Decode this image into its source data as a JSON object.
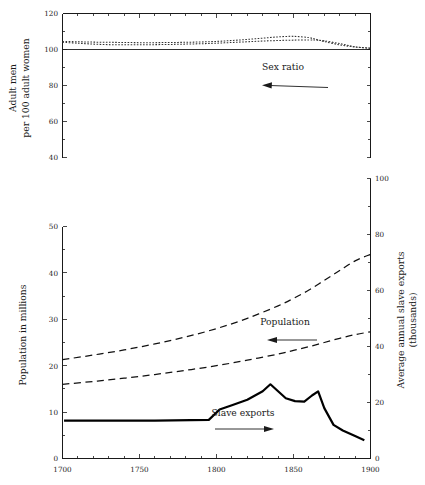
{
  "chart_data": [
    {
      "type": "line",
      "title": "Sex ratio",
      "panel": "top",
      "xlabel": "",
      "ylabel": "Adult men per 100 adult women",
      "ylabel_lines": [
        "Adult men",
        "per 100 adult women"
      ],
      "xlim": [
        1700,
        1900
      ],
      "ylim": [
        40,
        120
      ],
      "xticks": [
        1700,
        1750,
        1800,
        1850,
        1900
      ],
      "xtick_labels": [
        "",
        "",
        "",
        "",
        ""
      ],
      "yticks": [
        40,
        60,
        80,
        100,
        120
      ],
      "ytick_labels": [
        "40",
        "60",
        "80",
        "100",
        "120"
      ],
      "y_minor_step": 10,
      "x_minor_step": 10,
      "grid": false,
      "reference_line_y": 100,
      "annotations": [
        {
          "text": "Sex ratio",
          "x": 1840,
          "y": 82,
          "arrow": "left"
        }
      ],
      "series": [
        {
          "name": "Sex ratio (upper)",
          "style": "dotted",
          "x": [
            1700,
            1710,
            1720,
            1730,
            1740,
            1750,
            1760,
            1770,
            1780,
            1790,
            1800,
            1810,
            1820,
            1830,
            1840,
            1850,
            1860,
            1865,
            1870,
            1880,
            1890,
            1900
          ],
          "values": [
            104.5,
            104.3,
            104.1,
            104.0,
            103.9,
            103.8,
            103.8,
            103.9,
            104.0,
            104.2,
            104.5,
            105.0,
            105.6,
            106.3,
            107.0,
            107.3,
            106.6,
            105.6,
            104.4,
            102.6,
            101.4,
            100.8
          ]
        },
        {
          "name": "Sex ratio (lower)",
          "style": "dotted",
          "x": [
            1700,
            1710,
            1720,
            1730,
            1740,
            1750,
            1760,
            1770,
            1780,
            1790,
            1800,
            1810,
            1820,
            1830,
            1840,
            1850,
            1860,
            1865,
            1870,
            1880,
            1890,
            1900
          ],
          "values": [
            104.0,
            103.5,
            103.0,
            102.7,
            102.6,
            102.6,
            102.7,
            102.8,
            103.0,
            103.2,
            103.5,
            103.9,
            104.3,
            104.7,
            105.0,
            105.2,
            105.3,
            105.2,
            104.8,
            103.3,
            101.5,
            100.6
          ]
        }
      ]
    },
    {
      "type": "line",
      "title": "Population and slave exports",
      "panel": "bottom",
      "xlabel": "",
      "ylabel": "Population in millions",
      "ylabel_right": "Average annual slave exports (thousands)",
      "ylabel_right_lines": [
        "Average annual slave exports",
        "(thousands)"
      ],
      "xlim": [
        1700,
        1900
      ],
      "ylim": [
        0,
        50
      ],
      "ylim_right": [
        0,
        100
      ],
      "xticks": [
        1700,
        1750,
        1800,
        1850,
        1900
      ],
      "xtick_labels": [
        "1700",
        "1750",
        "1800",
        "1850",
        "1900"
      ],
      "yticks": [
        0,
        10,
        20,
        30,
        40,
        50
      ],
      "ytick_labels": [
        "0",
        "10",
        "20",
        "30",
        "40",
        "50"
      ],
      "y_minor_step": 5,
      "x_minor_step": 10,
      "yticks_right": [
        0,
        20,
        40,
        60,
        80,
        100
      ],
      "ytick_labels_right": [
        "0",
        "20",
        "40",
        "60",
        "80",
        "100"
      ],
      "y_minor_step_right": 10,
      "grid": false,
      "annotations": [
        {
          "text": "Population",
          "x": 1805,
          "y": 27.5,
          "arrow": "left"
        },
        {
          "text": "Slave exports",
          "x": 1790,
          "y": 10.5,
          "arrow": "right"
        }
      ],
      "series": [
        {
          "name": "Population (upper estimate)",
          "style": "dashed",
          "axis": "left",
          "x": [
            1700,
            1720,
            1740,
            1760,
            1780,
            1800,
            1820,
            1840,
            1850,
            1860,
            1870,
            1880,
            1890,
            1900
          ],
          "values": [
            21.3,
            22.3,
            23.4,
            24.7,
            26.2,
            28.0,
            30.2,
            32.9,
            34.5,
            36.3,
            38.4,
            40.5,
            42.6,
            44.0
          ]
        },
        {
          "name": "Population (lower estimate)",
          "style": "dashed",
          "axis": "left",
          "x": [
            1700,
            1720,
            1740,
            1760,
            1780,
            1800,
            1820,
            1840,
            1850,
            1860,
            1870,
            1880,
            1890,
            1900
          ],
          "values": [
            16.0,
            16.6,
            17.3,
            18.1,
            19.0,
            20.0,
            21.2,
            22.5,
            23.3,
            24.1,
            25.0,
            25.9,
            26.7,
            27.3
          ]
        },
        {
          "name": "Slave exports",
          "style": "solid",
          "axis": "right",
          "x": [
            1701,
            1760,
            1795,
            1802,
            1810,
            1820,
            1830,
            1835,
            1845,
            1851,
            1857,
            1862,
            1866,
            1870,
            1876,
            1882,
            1890,
            1896
          ],
          "values": [
            13.5,
            13.5,
            13.8,
            17.5,
            19.0,
            21.0,
            24.0,
            26.5,
            21.5,
            20.5,
            20.3,
            22.5,
            24.0,
            18.0,
            12.0,
            10.0,
            8.0,
            6.5
          ]
        }
      ]
    }
  ],
  "panels": {
    "top": {
      "ylabel_line1": "Adult men",
      "ylabel_line2": "per 100 adult women",
      "ytick_40": "40",
      "ytick_60": "60",
      "ytick_80": "80",
      "ytick_100": "100",
      "ytick_120": "120",
      "annotation_sex_ratio": "Sex ratio"
    },
    "bottom": {
      "ylabel_left": "Population in millions",
      "ylabel_right_line1": "Average annual slave exports",
      "ylabel_right_line2": "(thousands)",
      "ytick_0": "0",
      "ytick_10": "10",
      "ytick_20": "20",
      "ytick_30": "30",
      "ytick_40": "40",
      "ytick_50": "50",
      "rtick_0": "0",
      "rtick_20": "20",
      "rtick_40": "40",
      "rtick_60": "60",
      "rtick_80": "80",
      "rtick_100": "100",
      "xtick_1700": "1700",
      "xtick_1750": "1750",
      "xtick_1800": "1800",
      "xtick_1850": "1850",
      "xtick_1900": "1900",
      "annotation_population": "Population",
      "annotation_slave_exports": "Slave exports"
    }
  },
  "colors": {
    "ink": "#1a1a1a",
    "background": "#ffffff",
    "series_solid": "#000000",
    "series_dashed": "#111111",
    "series_dotted": "#333333"
  }
}
